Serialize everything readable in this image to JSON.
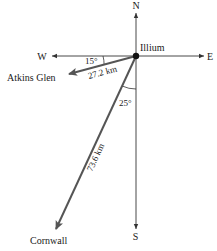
{
  "diagram": {
    "compass": {
      "north": "N",
      "south": "S",
      "east": "E",
      "west": "W"
    },
    "origin": {
      "label": "Illium"
    },
    "vectors": [
      {
        "name": "atkins-glen",
        "label": "Atkins Glen",
        "distance": "27.2 km",
        "angle": "15°",
        "angle_reference": "W",
        "direction": "15° south of west"
      },
      {
        "name": "cornwall",
        "label": "Cornwall",
        "distance": "73.6 km",
        "angle": "25°",
        "angle_reference": "S",
        "direction": "25° west of south"
      }
    ],
    "colors": {
      "axis": "#333333",
      "vector": "#555555",
      "dot": "#111111",
      "text": "#1a1a1a"
    }
  }
}
